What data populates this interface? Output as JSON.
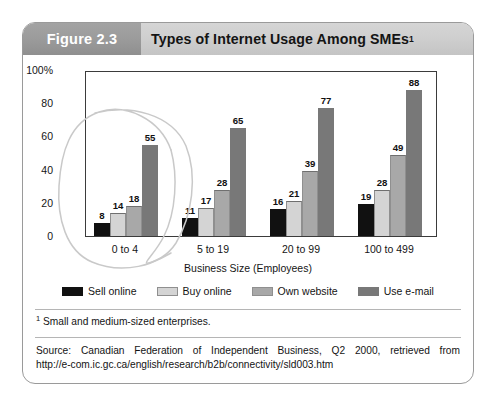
{
  "figure": {
    "number_label": "Figure 2.3",
    "title": "Types of Internet Usage Among SMEs",
    "title_superscript": "1"
  },
  "footnote": {
    "marker": "1",
    "text": " Small and medium-sized enterprises."
  },
  "source": {
    "line1": "Source: Canadian Federation of Independent Business, Q2 2000, retrieved from",
    "line2": "http://e-com.ic.gc.ca/english/research/b2b/connectivity/sld003.htm"
  },
  "annotation": {
    "type": "hand-drawn-ellipse",
    "target": "0 to 4",
    "color": "#c9c9c9"
  },
  "colors": {
    "sell_online": "#111111",
    "buy_online": "#d4d4d4",
    "own_website": "#a8a8a8",
    "use_email": "#787878",
    "axis": "#3b3b3b",
    "header_bar": "#cccccc",
    "figure_number_bar": "#9a9a9a",
    "frame_border": "#9a9a9a"
  },
  "chart_data": {
    "type": "bar",
    "title": "Types of Internet Usage Among SMEs",
    "xlabel": "Business Size (Employees)",
    "ylabel": "",
    "ylim": [
      0,
      100
    ],
    "yticks": [
      0,
      20,
      40,
      60,
      80,
      100
    ],
    "ytick_labels": [
      "0",
      "20",
      "40",
      "60",
      "80",
      "100%"
    ],
    "grid": false,
    "legend_position": "bottom",
    "categories": [
      "0 to 4",
      "5 to 19",
      "20 to 99",
      "100 to 499"
    ],
    "series": [
      {
        "name": "Sell online",
        "color": "#111111",
        "values": [
          8,
          11,
          16,
          19
        ]
      },
      {
        "name": "Buy online",
        "color": "#d4d4d4",
        "values": [
          14,
          17,
          21,
          28
        ]
      },
      {
        "name": "Own website",
        "color": "#a8a8a8",
        "values": [
          18,
          28,
          39,
          49
        ]
      },
      {
        "name": "Use e-mail",
        "color": "#787878",
        "values": [
          55,
          65,
          77,
          88
        ]
      }
    ]
  }
}
